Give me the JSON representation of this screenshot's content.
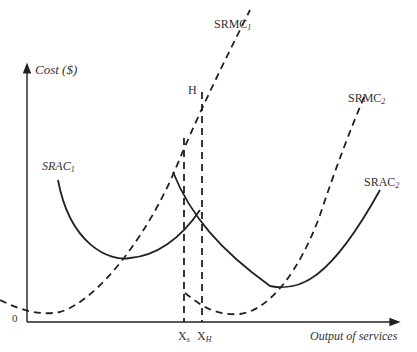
{
  "diagram": {
    "y_axis_label": "Cost ($)",
    "x_axis_label": "Output of services",
    "origin_label": "0",
    "point_label_H": "H",
    "x_labels": {
      "xs": "X",
      "xs_sub": "s",
      "xh": "X",
      "xh_sub": "H"
    },
    "curves": [
      {
        "id": "SRAC1",
        "label": "SRAC",
        "sub": "1",
        "style": "solid"
      },
      {
        "id": "SRMC1",
        "label": "SRMC",
        "sub": "1",
        "style": "dashed"
      },
      {
        "id": "SRAC2",
        "label": "SRAC",
        "sub": "2",
        "style": "solid"
      },
      {
        "id": "SRMC2",
        "label": "SRMC",
        "sub": "2",
        "style": "dashed"
      }
    ]
  }
}
